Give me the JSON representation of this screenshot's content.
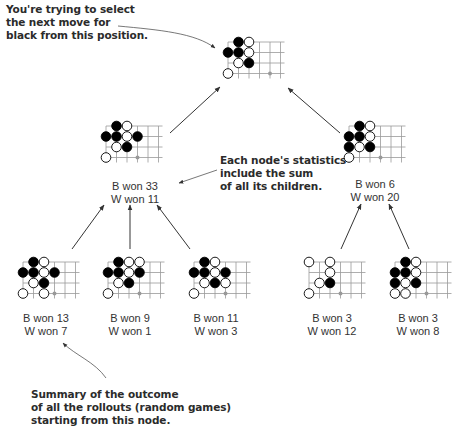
{
  "callouts": {
    "top": "You're trying to select\nthe next move for\nblack from this position.",
    "middle": "Each node's statistics\ninclude the sum\nof all its children.",
    "bottom": "Summary of the outcome\nof all the rollouts (random games)\nstarting from this node."
  },
  "colors": {
    "grid": "#999999",
    "black_stone": "#000000",
    "white_stone": "#ffffff",
    "stone_outline": "#000000",
    "marker": "#999999",
    "arrow": "#333333"
  },
  "tree": {
    "root": {
      "id": "root",
      "stones": [
        {
          "c": 1,
          "r": 0,
          "color": "B"
        },
        {
          "c": 2,
          "r": 0,
          "color": "W"
        },
        {
          "c": 0,
          "r": 1,
          "color": "B"
        },
        {
          "c": 1,
          "r": 1,
          "color": "B"
        },
        {
          "c": 2,
          "r": 1,
          "color": "W"
        },
        {
          "c": 1,
          "r": 2,
          "color": "W"
        },
        {
          "c": 2,
          "r": 2,
          "color": "B"
        },
        {
          "c": 0,
          "r": 3,
          "color": "W"
        }
      ],
      "marker": {
        "c": 4,
        "r": 3
      }
    },
    "level1": [
      {
        "id": "mid-left",
        "b_label": "B won 33",
        "w_label": "W won 11",
        "stones": [
          {
            "c": 1,
            "r": 0,
            "color": "B"
          },
          {
            "c": 2,
            "r": 0,
            "color": "W"
          },
          {
            "c": 0,
            "r": 1,
            "color": "B"
          },
          {
            "c": 1,
            "r": 1,
            "color": "B"
          },
          {
            "c": 2,
            "r": 1,
            "color": "W"
          },
          {
            "c": 3,
            "r": 1,
            "color": "B"
          },
          {
            "c": 1,
            "r": 2,
            "color": "W"
          },
          {
            "c": 2,
            "r": 2,
            "color": "B"
          },
          {
            "c": 0,
            "r": 3,
            "color": "W"
          }
        ],
        "marker": {
          "c": 3,
          "r": 3
        }
      },
      {
        "id": "mid-right",
        "b_label": "B won 6",
        "w_label": "W won 20",
        "stones": [
          {
            "c": 1,
            "r": 0,
            "color": "B"
          },
          {
            "c": 2,
            "r": 0,
            "color": "W"
          },
          {
            "c": 0,
            "r": 1,
            "color": "B"
          },
          {
            "c": 1,
            "r": 1,
            "color": "B"
          },
          {
            "c": 2,
            "r": 1,
            "color": "W"
          },
          {
            "c": 0,
            "r": 2,
            "color": "B"
          },
          {
            "c": 1,
            "r": 2,
            "color": "W"
          },
          {
            "c": 2,
            "r": 2,
            "color": "B"
          },
          {
            "c": 0,
            "r": 3,
            "color": "W"
          }
        ],
        "marker": {
          "c": 3,
          "r": 3
        }
      }
    ],
    "level2": [
      {
        "id": "leaf-1",
        "b_label": "B won 13",
        "w_label": "W won 7",
        "stones": [
          {
            "c": 1,
            "r": 0,
            "color": "B"
          },
          {
            "c": 2,
            "r": 0,
            "color": "W"
          },
          {
            "c": 0,
            "r": 1,
            "color": "B"
          },
          {
            "c": 1,
            "r": 1,
            "color": "B"
          },
          {
            "c": 2,
            "r": 1,
            "color": "W"
          },
          {
            "c": 3,
            "r": 1,
            "color": "B"
          },
          {
            "c": 1,
            "r": 2,
            "color": "W"
          },
          {
            "c": 2,
            "r": 2,
            "color": "B"
          },
          {
            "c": 0,
            "r": 3,
            "color": "W"
          },
          {
            "c": 2,
            "r": 3,
            "color": "W"
          }
        ],
        "marker": {
          "c": 3,
          "r": 3
        }
      },
      {
        "id": "leaf-2",
        "b_label": "B won 9",
        "w_label": "W won 1",
        "stones": [
          {
            "c": 1,
            "r": 0,
            "color": "B"
          },
          {
            "c": 2,
            "r": 0,
            "color": "W"
          },
          {
            "c": 3,
            "r": 0,
            "color": "W"
          },
          {
            "c": 0,
            "r": 1,
            "color": "B"
          },
          {
            "c": 1,
            "r": 1,
            "color": "B"
          },
          {
            "c": 2,
            "r": 1,
            "color": "W"
          },
          {
            "c": 3,
            "r": 1,
            "color": "B"
          },
          {
            "c": 1,
            "r": 2,
            "color": "W"
          },
          {
            "c": 2,
            "r": 2,
            "color": "B"
          },
          {
            "c": 0,
            "r": 3,
            "color": "W"
          }
        ],
        "marker": {
          "c": 3,
          "r": 3
        }
      },
      {
        "id": "leaf-3",
        "b_label": "B won 11",
        "w_label": "W won 3",
        "stones": [
          {
            "c": 1,
            "r": 0,
            "color": "B"
          },
          {
            "c": 2,
            "r": 0,
            "color": "W"
          },
          {
            "c": 0,
            "r": 1,
            "color": "B"
          },
          {
            "c": 1,
            "r": 1,
            "color": "B"
          },
          {
            "c": 2,
            "r": 1,
            "color": "W"
          },
          {
            "c": 3,
            "r": 1,
            "color": "B"
          },
          {
            "c": 1,
            "r": 2,
            "color": "W"
          },
          {
            "c": 2,
            "r": 2,
            "color": "B"
          },
          {
            "c": 3,
            "r": 2,
            "color": "W"
          },
          {
            "c": 0,
            "r": 3,
            "color": "W"
          }
        ],
        "marker": {
          "c": 3,
          "r": 3
        }
      },
      {
        "id": "leaf-4",
        "b_label": "B won 3",
        "w_label": "W won 12",
        "stones": [
          {
            "c": 0,
            "r": 0,
            "color": "W"
          },
          {
            "c": 2,
            "r": 0,
            "color": "W"
          },
          {
            "c": 2,
            "r": 1,
            "color": "W"
          },
          {
            "c": 1,
            "r": 2,
            "color": "W"
          },
          {
            "c": 2,
            "r": 2,
            "color": "B"
          },
          {
            "c": 0,
            "r": 3,
            "color": "W"
          }
        ],
        "marker": {
          "c": 3,
          "r": 3
        }
      },
      {
        "id": "leaf-5",
        "b_label": "B won 3",
        "w_label": "W won 8",
        "stones": [
          {
            "c": 1,
            "r": 0,
            "color": "B"
          },
          {
            "c": 2,
            "r": 0,
            "color": "W"
          },
          {
            "c": 0,
            "r": 1,
            "color": "B"
          },
          {
            "c": 1,
            "r": 1,
            "color": "B"
          },
          {
            "c": 2,
            "r": 1,
            "color": "W"
          },
          {
            "c": 0,
            "r": 2,
            "color": "B"
          },
          {
            "c": 1,
            "r": 2,
            "color": "W"
          },
          {
            "c": 2,
            "r": 2,
            "color": "B"
          },
          {
            "c": 0,
            "r": 3,
            "color": "W"
          },
          {
            "c": 1,
            "r": 3,
            "color": "W"
          }
        ],
        "marker": {
          "c": 3,
          "r": 3
        }
      }
    ]
  }
}
